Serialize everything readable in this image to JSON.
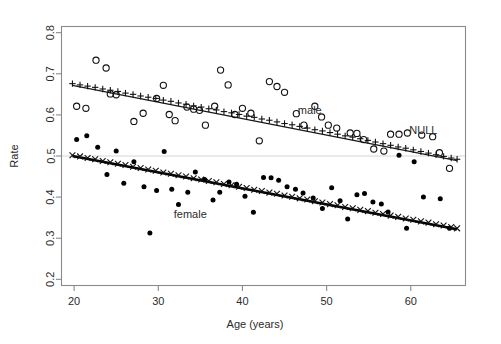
{
  "chart_data": {
    "type": "scatter",
    "title": "",
    "xlabel": "Age (years)",
    "ylabel": "Rate",
    "xlim": [
      18.5,
      66.5
    ],
    "ylim": [
      0.185,
      0.815
    ],
    "xticks": [
      20,
      30,
      40,
      50,
      60
    ],
    "yticks": [
      0.2,
      0.3,
      0.4,
      0.5,
      0.6,
      0.7,
      0.8
    ],
    "grid": false,
    "legend_position": "inline-annotations",
    "annotations": [
      {
        "text": "male",
        "x": 48.0,
        "y": 0.602,
        "name": "male-series-label"
      },
      {
        "text": "female",
        "x": 33.8,
        "y": 0.348,
        "name": "female-series-label"
      },
      {
        "text": "NULL",
        "x": 61.5,
        "y": 0.553,
        "name": "null-reference-label"
      }
    ],
    "reference_lines": [
      {
        "name": "null-rate-line",
        "orientation": "horizontal",
        "y": 0.5,
        "color": "#d8d2d2",
        "label": "NULL"
      }
    ],
    "series": [
      {
        "name": "male-observed",
        "marker": "open-circle",
        "color": "#111111",
        "points": [
          [
            20.3,
            0.621
          ],
          [
            21.4,
            0.616
          ],
          [
            22.6,
            0.733
          ],
          [
            23.8,
            0.714
          ],
          [
            24.3,
            0.651
          ],
          [
            25.0,
            0.649
          ],
          [
            27.1,
            0.584
          ],
          [
            28.2,
            0.604
          ],
          [
            29.8,
            0.64
          ],
          [
            30.6,
            0.672
          ],
          [
            31.3,
            0.601
          ],
          [
            32.0,
            0.586
          ],
          [
            33.4,
            0.619
          ],
          [
            34.2,
            0.614
          ],
          [
            34.9,
            0.611
          ],
          [
            35.6,
            0.575
          ],
          [
            36.7,
            0.621
          ],
          [
            37.4,
            0.709
          ],
          [
            38.3,
            0.673
          ],
          [
            39.1,
            0.601
          ],
          [
            40.0,
            0.616
          ],
          [
            41.0,
            0.604
          ],
          [
            42.0,
            0.537
          ],
          [
            43.2,
            0.681
          ],
          [
            44.1,
            0.669
          ],
          [
            45.0,
            0.655
          ],
          [
            46.4,
            0.603
          ],
          [
            47.3,
            0.575
          ],
          [
            48.6,
            0.621
          ],
          [
            49.4,
            0.595
          ],
          [
            50.2,
            0.575
          ],
          [
            51.2,
            0.568
          ],
          [
            52.8,
            0.556
          ],
          [
            53.6,
            0.555
          ],
          [
            54.4,
            0.54
          ],
          [
            55.6,
            0.517
          ],
          [
            56.8,
            0.512
          ],
          [
            57.6,
            0.553
          ],
          [
            58.6,
            0.553
          ],
          [
            59.6,
            0.556
          ],
          [
            61.3,
            0.551
          ],
          [
            62.6,
            0.547
          ],
          [
            63.4,
            0.508
          ],
          [
            64.6,
            0.47
          ]
        ]
      },
      {
        "name": "male-fitted",
        "marker": "plus",
        "color": "#111111",
        "points": [
          [
            19.8,
            0.676
          ],
          [
            20.7,
            0.673
          ],
          [
            21.6,
            0.67
          ],
          [
            22.5,
            0.667
          ],
          [
            23.4,
            0.663
          ],
          [
            24.3,
            0.66
          ],
          [
            25.2,
            0.657
          ],
          [
            26.1,
            0.653
          ],
          [
            27.0,
            0.65
          ],
          [
            27.9,
            0.646
          ],
          [
            28.8,
            0.643
          ],
          [
            29.7,
            0.64
          ],
          [
            30.6,
            0.636
          ],
          [
            31.5,
            0.633
          ],
          [
            32.4,
            0.629
          ],
          [
            33.3,
            0.626
          ],
          [
            34.2,
            0.622
          ],
          [
            35.1,
            0.619
          ],
          [
            36.0,
            0.615
          ],
          [
            36.9,
            0.612
          ],
          [
            37.8,
            0.608
          ],
          [
            38.7,
            0.605
          ],
          [
            39.6,
            0.601
          ],
          [
            40.5,
            0.597
          ],
          [
            41.4,
            0.594
          ],
          [
            42.3,
            0.59
          ],
          [
            43.2,
            0.587
          ],
          [
            44.1,
            0.583
          ],
          [
            45.0,
            0.579
          ],
          [
            45.9,
            0.576
          ],
          [
            46.8,
            0.572
          ],
          [
            47.7,
            0.568
          ],
          [
            48.6,
            0.564
          ],
          [
            49.5,
            0.561
          ],
          [
            50.4,
            0.557
          ],
          [
            51.3,
            0.553
          ],
          [
            52.2,
            0.549
          ],
          [
            53.1,
            0.546
          ],
          [
            54.0,
            0.542
          ],
          [
            54.9,
            0.538
          ],
          [
            55.8,
            0.534
          ],
          [
            56.7,
            0.53
          ],
          [
            57.6,
            0.526
          ],
          [
            58.5,
            0.522
          ],
          [
            59.4,
            0.519
          ],
          [
            60.3,
            0.515
          ],
          [
            61.2,
            0.511
          ],
          [
            62.1,
            0.507
          ],
          [
            63.0,
            0.503
          ],
          [
            63.9,
            0.499
          ],
          [
            64.8,
            0.495
          ],
          [
            65.5,
            0.492
          ]
        ]
      },
      {
        "name": "female-observed",
        "marker": "filled-circle",
        "color": "#000000",
        "points": [
          [
            20.3,
            0.54
          ],
          [
            21.5,
            0.549
          ],
          [
            22.8,
            0.521
          ],
          [
            23.9,
            0.455
          ],
          [
            25.0,
            0.512
          ],
          [
            25.9,
            0.434
          ],
          [
            27.1,
            0.486
          ],
          [
            28.3,
            0.425
          ],
          [
            29.0,
            0.313
          ],
          [
            29.8,
            0.416
          ],
          [
            30.7,
            0.511
          ],
          [
            31.6,
            0.419
          ],
          [
            32.4,
            0.382
          ],
          [
            33.5,
            0.412
          ],
          [
            34.4,
            0.461
          ],
          [
            35.5,
            0.443
          ],
          [
            36.5,
            0.393
          ],
          [
            37.3,
            0.412
          ],
          [
            38.4,
            0.437
          ],
          [
            39.3,
            0.431
          ],
          [
            40.3,
            0.402
          ],
          [
            41.3,
            0.363
          ],
          [
            42.5,
            0.448
          ],
          [
            43.4,
            0.447
          ],
          [
            44.3,
            0.441
          ],
          [
            45.3,
            0.425
          ],
          [
            46.3,
            0.419
          ],
          [
            47.2,
            0.41
          ],
          [
            48.4,
            0.398
          ],
          [
            49.5,
            0.372
          ],
          [
            50.6,
            0.423
          ],
          [
            51.6,
            0.391
          ],
          [
            52.5,
            0.347
          ],
          [
            53.6,
            0.406
          ],
          [
            54.5,
            0.409
          ],
          [
            55.5,
            0.388
          ],
          [
            56.5,
            0.383
          ],
          [
            57.3,
            0.364
          ],
          [
            58.6,
            0.502
          ],
          [
            59.5,
            0.324
          ],
          [
            60.4,
            0.486
          ],
          [
            61.5,
            0.4
          ],
          [
            63.5,
            0.396
          ],
          [
            64.6,
            0.324
          ]
        ]
      },
      {
        "name": "female-fitted",
        "marker": "cross",
        "color": "#111111",
        "points": [
          [
            19.8,
            0.502
          ],
          [
            20.7,
            0.499
          ],
          [
            21.6,
            0.495
          ],
          [
            22.5,
            0.492
          ],
          [
            23.4,
            0.488
          ],
          [
            24.3,
            0.485
          ],
          [
            25.2,
            0.481
          ],
          [
            26.1,
            0.478
          ],
          [
            27.0,
            0.474
          ],
          [
            27.9,
            0.471
          ],
          [
            28.8,
            0.467
          ],
          [
            29.7,
            0.464
          ],
          [
            30.6,
            0.46
          ],
          [
            31.5,
            0.457
          ],
          [
            32.4,
            0.453
          ],
          [
            33.3,
            0.45
          ],
          [
            34.2,
            0.446
          ],
          [
            35.1,
            0.443
          ],
          [
            36.0,
            0.439
          ],
          [
            36.9,
            0.436
          ],
          [
            37.8,
            0.432
          ],
          [
            38.7,
            0.429
          ],
          [
            39.6,
            0.425
          ],
          [
            40.5,
            0.422
          ],
          [
            41.4,
            0.418
          ],
          [
            42.3,
            0.415
          ],
          [
            43.2,
            0.411
          ],
          [
            44.1,
            0.408
          ],
          [
            45.0,
            0.404
          ],
          [
            45.9,
            0.401
          ],
          [
            46.8,
            0.397
          ],
          [
            47.7,
            0.394
          ],
          [
            48.6,
            0.39
          ],
          [
            49.5,
            0.387
          ],
          [
            50.4,
            0.383
          ],
          [
            51.3,
            0.38
          ],
          [
            52.2,
            0.376
          ],
          [
            53.1,
            0.373
          ],
          [
            54.0,
            0.369
          ],
          [
            54.9,
            0.366
          ],
          [
            55.8,
            0.362
          ],
          [
            56.7,
            0.359
          ],
          [
            57.6,
            0.355
          ],
          [
            58.5,
            0.352
          ],
          [
            59.4,
            0.348
          ],
          [
            60.3,
            0.345
          ],
          [
            61.2,
            0.341
          ],
          [
            62.1,
            0.338
          ],
          [
            63.0,
            0.334
          ],
          [
            63.9,
            0.331
          ],
          [
            64.8,
            0.327
          ],
          [
            65.5,
            0.324
          ]
        ]
      }
    ],
    "trend_lines": [
      {
        "name": "male-trend-line",
        "x0": 19.8,
        "y0": 0.672,
        "x1": 65.5,
        "y1": 0.489,
        "width": "thin"
      },
      {
        "name": "female-trend-line",
        "x0": 19.8,
        "y0": 0.5,
        "x1": 65.5,
        "y1": 0.322,
        "width": "thick"
      }
    ]
  }
}
